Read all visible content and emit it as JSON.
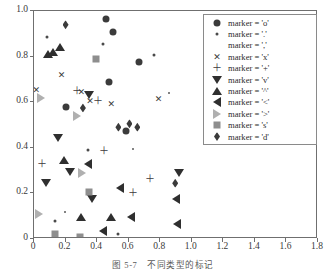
{
  "caption": {
    "number": "图 5-7",
    "text": "不同类型的标记"
  },
  "chart_data": {
    "type": "scatter",
    "title": "",
    "xlabel": "",
    "ylabel": "",
    "xlim": [
      0,
      1.8
    ],
    "ylim": [
      0,
      1.0
    ],
    "xticks": [
      "0",
      "0.2",
      "0.4",
      "0.6",
      "0.8",
      "1.0",
      "1.2",
      "1.4",
      "1.6",
      "1.8"
    ],
    "xtick_values": [
      0,
      0.2,
      0.4,
      0.6,
      0.8,
      1.0,
      1.2,
      1.4,
      1.6,
      1.8
    ],
    "yticks": [
      "0",
      "0.2",
      "0.4",
      "0.6",
      "0.8",
      "1.0"
    ],
    "ytick_values": [
      0,
      0.2,
      0.4,
      0.6,
      0.8,
      1.0
    ],
    "grid": false,
    "legend_position": "upper right",
    "series": [
      {
        "name": "marker = 'o'",
        "marker": "o",
        "color": "#3b3b3b",
        "points": [
          [
            0.455,
            0.965
          ],
          [
            0.5,
            0.91
          ],
          [
            0.475,
            0.69
          ],
          [
            0.665,
            0.775
          ],
          [
            0.585,
            0.475
          ],
          [
            0.2,
            0.58
          ]
        ]
      },
      {
        "name": "marker = '.'",
        "marker": ".",
        "color": "#4a4a4a",
        "points": [
          [
            0.44,
            0.855
          ],
          [
            0.085,
            0.885
          ],
          [
            0.76,
            0.805
          ],
          [
            0.53,
            0.02
          ],
          [
            0.345,
            0.39
          ],
          [
            0.135,
            0.08
          ]
        ]
      },
      {
        "name": "marker = ','",
        "marker": ",",
        "color": "#5a5a5a",
        "points": [
          [
            0.63,
            0.395
          ],
          [
            0.195,
            0.12
          ],
          [
            0.855,
            0.64
          ]
        ]
      },
      {
        "name": "marker = 'x'",
        "marker": "x",
        "color": "#3b3b3b",
        "points": [
          [
            0.3,
            0.645
          ],
          [
            0.355,
            0.605
          ],
          [
            0.175,
            0.72
          ],
          [
            0.49,
            0.59
          ],
          [
            0.79,
            0.615
          ],
          [
            0.015,
            0.655
          ]
        ]
      },
      {
        "name": "marker = '+'",
        "marker": "+",
        "color": "#3b3b3b",
        "points": [
          [
            0.275,
            0.65
          ],
          [
            0.05,
            0.33
          ],
          [
            0.445,
            0.385
          ],
          [
            0.63,
            0.2
          ],
          [
            0.405,
            0.605
          ],
          [
            0.735,
            0.265
          ]
        ]
      },
      {
        "name": "marker = 'v'",
        "marker": "v",
        "color": "#2f2f2f",
        "points": [
          [
            0.35,
            0.63
          ],
          [
            0.155,
            0.445
          ],
          [
            0.075,
            0.245
          ],
          [
            0.37,
            0.175
          ],
          [
            0.23,
            0.295
          ],
          [
            0.92,
            0.29
          ]
        ]
      },
      {
        "name": "marker = '^'",
        "marker": "^",
        "color": "#2f2f2f",
        "points": [
          [
            0.09,
            0.81
          ],
          [
            0.12,
            0.82
          ],
          [
            0.19,
            0.345
          ],
          [
            0.295,
            0.095
          ],
          [
            0.49,
            0.095
          ],
          [
            0.165,
            0.84
          ]
        ]
      },
      {
        "name": "marker = '<'",
        "marker": "<",
        "color": "#2f2f2f",
        "points": [
          [
            0.34,
            0.33
          ],
          [
            0.545,
            0.225
          ],
          [
            0.615,
            0.095
          ],
          [
            0.9,
            0.175
          ],
          [
            0.905,
            0.065
          ],
          [
            0.44,
            0.035
          ]
        ]
      },
      {
        "name": "marker = '>'",
        "marker": ">",
        "color": "#b0b0b0",
        "points": [
          [
            0.27,
            0.54
          ],
          [
            0.305,
            0.29
          ],
          [
            0.03,
            0.11
          ],
          [
            0.045,
            0.62
          ]
        ]
      },
      {
        "name": "marker = 's'",
        "marker": "s",
        "color": "#8e8e8e",
        "points": [
          [
            0.395,
            0.79
          ],
          [
            0.35,
            0.205
          ],
          [
            0.13,
            0.02
          ],
          [
            0.29,
            0.01
          ]
        ]
      },
      {
        "name": "marker = 'd'",
        "marker": "d",
        "color": "#3b3b3b",
        "points": [
          [
            0.2,
            0.94
          ],
          [
            0.31,
            0.575
          ],
          [
            0.605,
            0.505
          ],
          [
            0.655,
            0.49
          ],
          [
            0.895,
            0.245
          ],
          [
            0.535,
            0.49
          ]
        ]
      }
    ]
  },
  "legend": {
    "items": [
      {
        "label": "marker = 'o'",
        "marker": "o"
      },
      {
        "label": "marker = '.'",
        "marker": "."
      },
      {
        "label": "marker = ','",
        "marker": ","
      },
      {
        "label": "marker = 'x'",
        "marker": "x"
      },
      {
        "label": "marker = '+'",
        "marker": "+"
      },
      {
        "label": "marker = 'v'",
        "marker": "v"
      },
      {
        "label": "marker = '^'",
        "marker": "^"
      },
      {
        "label": "marker = '<'",
        "marker": "<"
      },
      {
        "label": "marker = '>'",
        "marker": ">"
      },
      {
        "label": "marker = 's'",
        "marker": "s"
      },
      {
        "label": "marker = 'd'",
        "marker": "d"
      }
    ]
  },
  "colors": {
    "axis": "#6f6f6f",
    "dark_marker": "#3b3b3b",
    "grey_marker": "#8e8e8e",
    "light_marker": "#b0b0b0",
    "background": "#ffffff"
  }
}
